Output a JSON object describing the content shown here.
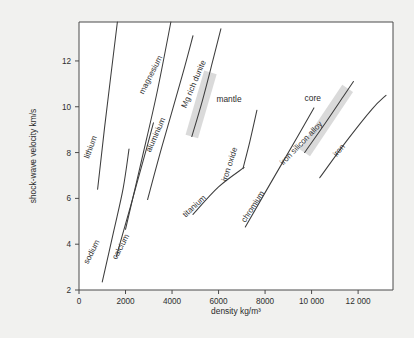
{
  "chart_data": {
    "type": "line",
    "title": "",
    "xlabel": "density kg/m³",
    "ylabel": "shock-wave velocity km/s",
    "xlim": [
      0,
      13500
    ],
    "ylim": [
      2,
      13.7
    ],
    "xticks": [
      0,
      2000,
      4000,
      6000,
      8000,
      10000,
      12000
    ],
    "xticklabels": [
      "0",
      "2000",
      "4000",
      "6000",
      "8000",
      "10 000",
      "12 000"
    ],
    "yticks": [
      2,
      4,
      6,
      8,
      10,
      12
    ],
    "yticklabels": [
      "2",
      "4",
      "6",
      "8",
      "10",
      "12"
    ],
    "grid": false,
    "legend": "inline-labels",
    "series": [
      {
        "name": "lithium",
        "label": "lithium",
        "points": [
          [
            800,
            6.4
          ],
          [
            1100,
            9.1
          ],
          [
            1650,
            13.7
          ]
        ]
      },
      {
        "name": "sodium",
        "label": "sodium",
        "points": [
          [
            1000,
            2.35
          ],
          [
            1500,
            4.6
          ],
          [
            1900,
            6.45
          ],
          [
            2150,
            8.15
          ]
        ]
      },
      {
        "name": "calcium",
        "label": "calcium",
        "points": [
          [
            1600,
            3.45
          ],
          [
            2200,
            5.6
          ],
          [
            2950,
            8.35
          ],
          [
            3200,
            9.3
          ]
        ]
      },
      {
        "name": "aluminium",
        "label": "aluminium",
        "points": [
          [
            2950,
            5.95
          ],
          [
            3550,
            8.2
          ],
          [
            4450,
            11.4
          ],
          [
            4900,
            13.1
          ]
        ]
      },
      {
        "name": "magnesium",
        "label": "magnesium",
        "points": [
          [
            2000,
            4.65
          ],
          [
            2700,
            7.7
          ],
          [
            3350,
            10.6
          ],
          [
            3950,
            13.7
          ]
        ]
      },
      {
        "name": "Mg rich dunite",
        "label": "Mg rich dunite",
        "points": [
          [
            4850,
            8.7
          ],
          [
            5300,
            10.25
          ],
          [
            5750,
            12.0
          ],
          [
            6100,
            13.4
          ]
        ]
      },
      {
        "name": "titanium",
        "label": "titanium",
        "points": [
          [
            4900,
            5.3
          ],
          [
            6000,
            6.5
          ],
          [
            7100,
            7.35
          ]
        ]
      },
      {
        "name": "iron oxide",
        "label": "iron oxide",
        "points": [
          [
            7050,
            7.3
          ],
          [
            7350,
            8.5
          ],
          [
            7650,
            9.85
          ]
        ]
      },
      {
        "name": "chromium",
        "label": "chromium",
        "points": [
          [
            7150,
            4.75
          ],
          [
            8200,
            6.6
          ],
          [
            9400,
            8.7
          ],
          [
            10100,
            9.95
          ]
        ]
      },
      {
        "name": "iron silicon alloy",
        "label": "iron silicon alloy",
        "points": [
          [
            9700,
            8.0
          ],
          [
            10600,
            9.3
          ],
          [
            11400,
            10.5
          ],
          [
            11800,
            11.1
          ]
        ]
      },
      {
        "name": "iron",
        "label": "iron",
        "points": [
          [
            10350,
            6.9
          ],
          [
            11500,
            8.5
          ],
          [
            12600,
            9.9
          ],
          [
            13200,
            10.5
          ]
        ]
      }
    ],
    "bands": [
      {
        "name": "mantle-band",
        "label": "mantle",
        "along_series": "Mg rich dunite",
        "start": [
          4850,
          8.7
        ],
        "end": [
          5650,
          11.5
        ],
        "width_px": 13
      },
      {
        "name": "core-band",
        "label": "core",
        "along_series": "iron silicon alloy",
        "start": [
          9700,
          8.0
        ],
        "end": [
          11550,
          10.8
        ],
        "width_px": 13
      }
    ],
    "annotations": [
      {
        "name": "mantle",
        "text": "mantle",
        "x": 6450,
        "y": 10.2,
        "rotation": 0
      },
      {
        "name": "core",
        "text": "core",
        "x": 10050,
        "y": 10.25,
        "rotation": 0
      }
    ]
  },
  "series_label_layout": [
    {
      "name": "lithium",
      "x": 93,
      "y": 148,
      "rotation": -70
    },
    {
      "name": "sodium",
      "x": 94,
      "y": 253,
      "rotation": -63
    },
    {
      "name": "calcium",
      "x": 123,
      "y": 248,
      "rotation": -62
    },
    {
      "name": "aluminium",
      "x": 158,
      "y": 136,
      "rotation": -66
    },
    {
      "name": "magnesium",
      "x": 153,
      "y": 76,
      "rotation": -63
    },
    {
      "name": "Mg rich dunite",
      "x": 196,
      "y": 85,
      "rotation": -67
    },
    {
      "name": "titanium",
      "x": 196,
      "y": 208,
      "rotation": -43
    },
    {
      "name": "iron oxide",
      "x": 232,
      "y": 165,
      "rotation": -72
    },
    {
      "name": "chromium",
      "x": 255,
      "y": 208,
      "rotation": -57
    },
    {
      "name": "iron silicon alloy",
      "x": 303,
      "y": 145,
      "rotation": -46
    },
    {
      "name": "iron",
      "x": 341,
      "y": 152,
      "rotation": -50
    }
  ]
}
